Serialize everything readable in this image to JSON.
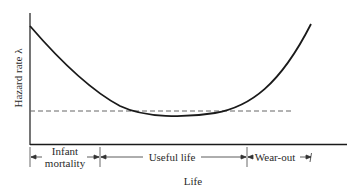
{
  "diagram": {
    "y_axis_label": "Hazard rate λ",
    "x_axis_label": "Life",
    "phases": [
      {
        "id": "infant",
        "line1": "Infant",
        "line2": "mortality"
      },
      {
        "id": "useful",
        "label": "Useful life"
      },
      {
        "id": "wearout",
        "label": "Wear-out"
      }
    ],
    "curve": {
      "description": "Decreasing hazard during infant mortality, roughly constant during useful life, increasing during wear-out",
      "points": [
        [
          30,
          26
        ],
        [
          60,
          55
        ],
        [
          100,
          92
        ],
        [
          130,
          110
        ],
        [
          165,
          117
        ],
        [
          200,
          115
        ],
        [
          235,
          108
        ],
        [
          265,
          90
        ],
        [
          290,
          60
        ],
        [
          311,
          24
        ]
      ]
    },
    "constant_rate_line": {
      "style": "dashed",
      "y": 111,
      "x_start": 30,
      "x_end": 293
    },
    "colors": {
      "ink": "#1a1a1a",
      "dashed": "#666666",
      "text": "#2a2a2a"
    }
  }
}
